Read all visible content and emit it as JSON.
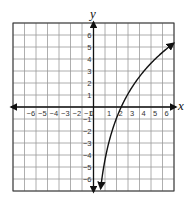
{
  "chart_data": {
    "type": "line",
    "title": "",
    "xlabel": "x",
    "ylabel": "y",
    "xlim": [
      -7,
      7
    ],
    "ylim": [
      -7,
      7
    ],
    "grid": true,
    "x_ticks": [
      -6,
      -5,
      -4,
      -3,
      -2,
      -1,
      0,
      1,
      2,
      3,
      4,
      5,
      6
    ],
    "y_ticks": [
      -6,
      -5,
      -4,
      -3,
      -2,
      -1,
      1,
      2,
      3,
      4,
      5,
      6
    ],
    "series": [
      {
        "name": "logarithmic curve",
        "description": "Increasing logarithmic curve with vertical asymptote at x = 0, arrows at both ends",
        "x": [
          0.7,
          0.8,
          1,
          1.5,
          2,
          2.4,
          3,
          4,
          5,
          6,
          7
        ],
        "y": [
          -6.2,
          -5.5,
          -4.4,
          -2.4,
          -0.9,
          0,
          1.1,
          2.5,
          3.6,
          4.6,
          5.3
        ]
      }
    ],
    "asymptote": {
      "type": "vertical",
      "x": 0
    },
    "annotations": []
  },
  "colors": {
    "grid": "#9a9a9a",
    "border": "#333333",
    "axis": "#111111",
    "curve": "#111111"
  }
}
